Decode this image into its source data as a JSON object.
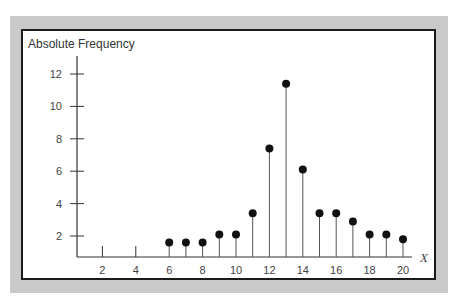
{
  "chart_data": {
    "type": "scatter",
    "subtype": "stem",
    "title": "",
    "ylabel": "Absolute Frequency",
    "xlabel": "X",
    "x": [
      6,
      7,
      8,
      9,
      10,
      11,
      12,
      13,
      14,
      15,
      16,
      17,
      18,
      19,
      20
    ],
    "values": [
      1.6,
      1.6,
      1.6,
      2.1,
      2.1,
      3.4,
      7.4,
      11.4,
      6.1,
      3.4,
      3.4,
      2.9,
      2.1,
      2.1,
      1.8
    ],
    "xticks": [
      2,
      4,
      6,
      8,
      10,
      12,
      14,
      16,
      18,
      20
    ],
    "yticks": [
      2,
      4,
      6,
      8,
      10,
      12
    ],
    "xlim": [
      0,
      20.5
    ],
    "ylim": [
      0.7,
      13
    ],
    "grid": false,
    "legend": null
  },
  "colors": {
    "frame_gray": "#c9c9c9",
    "frame_border": "#1a1a1a",
    "stem": "#555555",
    "marker": "#111111"
  }
}
